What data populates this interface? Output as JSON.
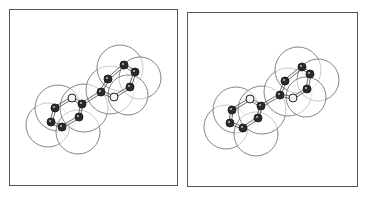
{
  "figure": {
    "type": "stereo-pair",
    "colors": {
      "frame": "#555555",
      "sphere_outline": "#777777",
      "sphere_fill": "#ffffff",
      "atom_dark": "#2a2a2a",
      "atom_light": "#f4f4f4",
      "atom_outline": "#222222",
      "bond": "#444444"
    },
    "panels": [
      {
        "id": "left",
        "spheres": [
          {
            "cx": 48,
            "cy": 125,
            "r": 22
          },
          {
            "cx": 58,
            "cy": 108,
            "r": 23
          },
          {
            "cx": 78,
            "cy": 132,
            "r": 22
          },
          {
            "cx": 84,
            "cy": 108,
            "r": 24
          },
          {
            "cx": 110,
            "cy": 90,
            "r": 24
          },
          {
            "cx": 120,
            "cy": 68,
            "r": 23
          },
          {
            "cx": 140,
            "cy": 78,
            "r": 21
          },
          {
            "cx": 128,
            "cy": 95,
            "r": 20
          }
        ],
        "atoms": [
          {
            "x": 55,
            "y": 108,
            "kind": "dark"
          },
          {
            "x": 51,
            "y": 122,
            "kind": "dark"
          },
          {
            "x": 62,
            "y": 127,
            "kind": "dark"
          },
          {
            "x": 79,
            "y": 117,
            "kind": "dark"
          },
          {
            "x": 82,
            "y": 104,
            "kind": "dark"
          },
          {
            "x": 72,
            "y": 98,
            "kind": "light"
          },
          {
            "x": 101,
            "y": 92,
            "kind": "dark"
          },
          {
            "x": 108,
            "y": 79,
            "kind": "dark"
          },
          {
            "x": 124,
            "y": 65,
            "kind": "dark"
          },
          {
            "x": 135,
            "y": 72,
            "kind": "dark"
          },
          {
            "x": 130,
            "y": 87,
            "kind": "dark"
          },
          {
            "x": 114,
            "y": 97,
            "kind": "light"
          }
        ]
      },
      {
        "id": "right",
        "spheres": [
          {
            "cx": 226,
            "cy": 127,
            "r": 22
          },
          {
            "cx": 236,
            "cy": 110,
            "r": 23
          },
          {
            "cx": 256,
            "cy": 134,
            "r": 22
          },
          {
            "cx": 262,
            "cy": 110,
            "r": 24
          },
          {
            "cx": 288,
            "cy": 92,
            "r": 24
          },
          {
            "cx": 298,
            "cy": 70,
            "r": 23
          },
          {
            "cx": 318,
            "cy": 80,
            "r": 21
          },
          {
            "cx": 306,
            "cy": 97,
            "r": 20
          }
        ],
        "atoms": [
          {
            "x": 232,
            "y": 110,
            "kind": "dark"
          },
          {
            "x": 230,
            "y": 123,
            "kind": "dark"
          },
          {
            "x": 243,
            "y": 128,
            "kind": "dark"
          },
          {
            "x": 258,
            "y": 118,
            "kind": "dark"
          },
          {
            "x": 261,
            "y": 106,
            "kind": "dark"
          },
          {
            "x": 250,
            "y": 99,
            "kind": "light"
          },
          {
            "x": 280,
            "y": 95,
            "kind": "dark"
          },
          {
            "x": 285,
            "y": 81,
            "kind": "dark"
          },
          {
            "x": 302,
            "y": 67,
            "kind": "dark"
          },
          {
            "x": 310,
            "y": 74,
            "kind": "dark"
          },
          {
            "x": 307,
            "y": 89,
            "kind": "dark"
          },
          {
            "x": 293,
            "y": 98,
            "kind": "light"
          }
        ]
      }
    ],
    "bonds": [
      [
        0,
        1
      ],
      [
        1,
        2
      ],
      [
        2,
        3
      ],
      [
        3,
        4
      ],
      [
        4,
        5
      ],
      [
        5,
        0
      ],
      [
        4,
        6
      ],
      [
        6,
        7
      ],
      [
        7,
        8
      ],
      [
        8,
        9
      ],
      [
        9,
        10
      ],
      [
        10,
        11
      ],
      [
        11,
        6
      ]
    ]
  }
}
